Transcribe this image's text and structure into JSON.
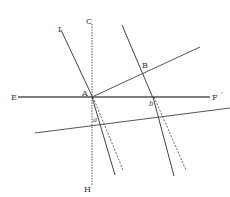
{
  "diagram": {
    "type": "geometric-refraction-figure",
    "labels": {
      "E": "E",
      "F": "F",
      "F_prime": "'",
      "C": "C",
      "H": "H",
      "I": "I",
      "A": "A",
      "B": "B",
      "a": "a",
      "b": "b"
    },
    "colors": {
      "line": "#444444",
      "background": "#ffffff"
    }
  }
}
